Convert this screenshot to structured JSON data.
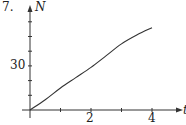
{
  "problem": {
    "number": "7."
  },
  "chart_data": {
    "type": "line",
    "title": "",
    "xlabel": "t",
    "ylabel": "N",
    "x": [
      0,
      0.5,
      1,
      1.5,
      2,
      2.5,
      3,
      3.5,
      4
    ],
    "series": [
      {
        "name": "N(t)",
        "values": [
          0,
          7,
          15,
          22,
          29,
          37,
          45,
          51,
          56
        ]
      }
    ],
    "xlim": [
      0,
      4.9
    ],
    "ylim": [
      0,
      65
    ],
    "xticks": [
      1,
      2,
      3,
      4
    ],
    "xtick_labels": {
      "2": "2",
      "4": "4"
    },
    "yticks": [
      10,
      20,
      30,
      40,
      50,
      60
    ],
    "ytick_labels": {
      "30": "30"
    },
    "grid": false,
    "legend": null
  },
  "labels": {
    "y_axis": "N",
    "x_axis": "t",
    "y30": "30",
    "x2": "2",
    "x4": "4"
  },
  "colors": {
    "line": "#333333",
    "axis": "#333333"
  }
}
